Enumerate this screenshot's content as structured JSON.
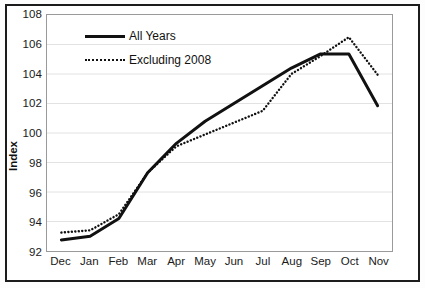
{
  "chart_data": {
    "type": "line",
    "title": "",
    "xlabel": "",
    "ylabel": "Index",
    "categories": [
      "Dec",
      "Jan",
      "Feb",
      "Mar",
      "Apr",
      "May",
      "Jun",
      "Jul",
      "Aug",
      "Sep",
      "Oct",
      "Nov"
    ],
    "ylim": [
      92,
      108
    ],
    "ytick_step": 2,
    "yticks": [
      108,
      106,
      104,
      102,
      100,
      98,
      96,
      94,
      92
    ],
    "ytick_labels": [
      "108",
      "106",
      "104",
      "102",
      "100",
      "98",
      "96",
      "94",
      "92"
    ],
    "grid": "horizontal",
    "legend_position": "top-left-inside",
    "series": [
      {
        "name": "All Years",
        "style": "solid",
        "color": "#111111",
        "values": [
          92.75,
          93.0,
          94.2,
          97.3,
          99.3,
          100.8,
          102.0,
          103.2,
          104.4,
          105.35,
          105.35,
          101.85
        ]
      },
      {
        "name": "Excluding 2008",
        "style": "dotted",
        "color": "#111111",
        "values": [
          93.25,
          93.4,
          94.5,
          97.3,
          99.1,
          99.9,
          100.7,
          101.5,
          104.0,
          105.2,
          106.5,
          103.95
        ]
      }
    ]
  },
  "legend": {
    "items": [
      {
        "label": "All Years"
      },
      {
        "label": "Excluding 2008"
      }
    ]
  },
  "axes": {
    "y_title": "Index"
  }
}
